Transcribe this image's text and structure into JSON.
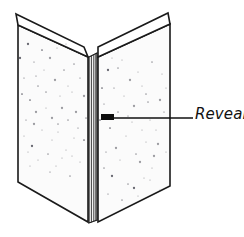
{
  "figure": {
    "background_color": "#ffffff",
    "line_color": "#1a1a1a",
    "face_color": "#fbfbfb",
    "speckle_color": "#4e4e58",
    "width": 244,
    "height": 237
  },
  "callout": {
    "label": "Reveal",
    "leader_start_x": 112,
    "leader_end_x": 193,
    "leader_y": 118,
    "marker_label": "reveal-marker"
  },
  "parts": [
    {
      "name": "left-panel-face",
      "label": "Left panel face"
    },
    {
      "name": "left-panel-top-edge",
      "label": "Left panel top edge"
    },
    {
      "name": "right-panel-face",
      "label": "Right panel face"
    },
    {
      "name": "right-panel-top-edge",
      "label": "Right panel top edge"
    },
    {
      "name": "reveal-channel",
      "label": "Reveal channel"
    }
  ],
  "geometry": {
    "left_face": "18,25 88,57 88,222 18,182",
    "left_top_edge": "16,14 84,47 88,57 18,25",
    "right_face": "98,57 170,24 170,186 98,222",
    "right_top_edge": "98,47 168,13 170,24 98,57",
    "reveal_outer": "89,57 97,53 97,220 89,223",
    "reveal_lines_x": [
      91.5,
      94.0,
      96.0
    ]
  },
  "speckles": {
    "left": [
      [
        28,
        44
      ],
      [
        41,
        36
      ],
      [
        57,
        48
      ],
      [
        70,
        40
      ],
      [
        34,
        62
      ],
      [
        50,
        58
      ],
      [
        64,
        70
      ],
      [
        78,
        52
      ],
      [
        24,
        78
      ],
      [
        38,
        86
      ],
      [
        55,
        80
      ],
      [
        72,
        92
      ],
      [
        30,
        100
      ],
      [
        46,
        108
      ],
      [
        60,
        96
      ],
      [
        76,
        112
      ],
      [
        26,
        120
      ],
      [
        42,
        130
      ],
      [
        58,
        124
      ],
      [
        74,
        138
      ],
      [
        32,
        146
      ],
      [
        48,
        154
      ],
      [
        66,
        150
      ],
      [
        80,
        162
      ],
      [
        22,
        94
      ],
      [
        36,
        112
      ],
      [
        52,
        140
      ],
      [
        68,
        120
      ],
      [
        80,
        78
      ],
      [
        44,
        70
      ],
      [
        62,
        108
      ],
      [
        30,
        166
      ],
      [
        50,
        172
      ],
      [
        70,
        176
      ],
      [
        24,
        136
      ],
      [
        84,
        96
      ],
      [
        84,
        140
      ],
      [
        38,
        160
      ],
      [
        56,
        166
      ],
      [
        74,
        64
      ],
      [
        20,
        58
      ],
      [
        66,
        44
      ],
      [
        46,
        92
      ],
      [
        58,
        132
      ],
      [
        78,
        128
      ],
      [
        34,
        124
      ],
      [
        28,
        152
      ],
      [
        62,
        158
      ],
      [
        42,
        50
      ],
      [
        72,
        156
      ],
      [
        52,
        118
      ],
      [
        86,
        118
      ],
      [
        36,
        76
      ],
      [
        68,
        86
      ]
    ],
    "right": [
      [
        108,
        70
      ],
      [
        122,
        60
      ],
      [
        138,
        72
      ],
      [
        152,
        62
      ],
      [
        114,
        88
      ],
      [
        130,
        80
      ],
      [
        146,
        94
      ],
      [
        162,
        74
      ],
      [
        104,
        104
      ],
      [
        118,
        112
      ],
      [
        134,
        106
      ],
      [
        150,
        120
      ],
      [
        110,
        128
      ],
      [
        126,
        136
      ],
      [
        142,
        130
      ],
      [
        158,
        144
      ],
      [
        106,
        152
      ],
      [
        120,
        160
      ],
      [
        136,
        154
      ],
      [
        152,
        168
      ],
      [
        112,
        176
      ],
      [
        128,
        184
      ],
      [
        144,
        178
      ],
      [
        160,
        190
      ],
      [
        102,
        88
      ],
      [
        116,
        148
      ],
      [
        132,
        122
      ],
      [
        148,
        102
      ],
      [
        164,
        112
      ],
      [
        124,
        96
      ],
      [
        140,
        162
      ],
      [
        156,
        130
      ],
      [
        108,
        194
      ],
      [
        122,
        200
      ],
      [
        138,
        196
      ],
      [
        154,
        156
      ],
      [
        100,
        120
      ],
      [
        166,
        88
      ],
      [
        166,
        152
      ],
      [
        118,
        68
      ],
      [
        134,
        188
      ],
      [
        150,
        180
      ],
      [
        104,
        168
      ],
      [
        146,
        142
      ],
      [
        128,
        116
      ],
      [
        160,
        100
      ],
      [
        112,
        58
      ],
      [
        142,
        86
      ]
    ]
  }
}
